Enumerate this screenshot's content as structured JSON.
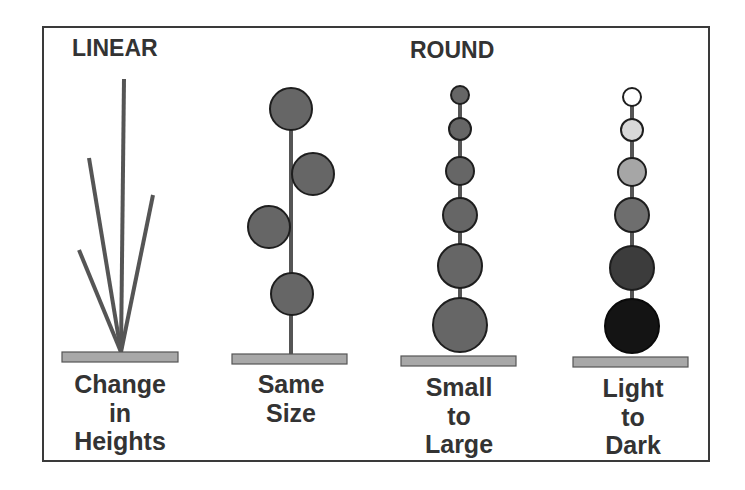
{
  "categories": [
    {
      "title": "LINEAR"
    },
    {
      "title": "ROUND"
    }
  ],
  "panels": [
    {
      "id": "change-in-heights",
      "group": "LINEAR",
      "label_lines": [
        "Change",
        "in",
        "Heights"
      ]
    },
    {
      "id": "same-size",
      "group": "ROUND",
      "label_lines": [
        "Same",
        "Size"
      ]
    },
    {
      "id": "small-to-large",
      "group": "ROUND",
      "label_lines": [
        "Small",
        "to",
        "Large"
      ]
    },
    {
      "id": "light-to-dark",
      "group": "ROUND",
      "label_lines": [
        "Light",
        "to",
        "Dark"
      ]
    }
  ],
  "colors": {
    "frame": "#3a3a3a",
    "stem": "#555555",
    "base_fill": "#a8a8a8",
    "base_stroke": "#555555",
    "circle_fill": "#666666",
    "circle_stroke": "#1e1e1e",
    "text": "#333333",
    "light_to_dark": [
      "#ffffff",
      "#d8d8d8",
      "#a6a6a6",
      "#6e6e6e",
      "#3c3c3c",
      "#141414"
    ]
  }
}
